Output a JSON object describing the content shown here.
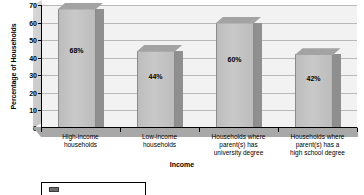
{
  "chart_data": {
    "type": "bar",
    "title": "",
    "xlabel": "Income",
    "ylabel": "Percentage of Households",
    "ylim": [
      0,
      70
    ],
    "ytick_step": 10,
    "yticks": [
      0,
      10,
      20,
      30,
      40,
      50,
      60,
      70
    ],
    "grid": true,
    "legend_position": "bottom-left",
    "style": "3d-column",
    "categories": [
      "High-income households",
      "Low-income households",
      "Households where parent(s) has university degree",
      "Households where parent(s) has a high school degree"
    ],
    "category_lines": [
      [
        "High-income",
        "households"
      ],
      [
        "Low-income",
        "households"
      ],
      [
        "Households where",
        "parent(s) has",
        "university degree"
      ],
      [
        "Households where",
        "parent(s) has a",
        "high school degree"
      ]
    ],
    "values": [
      68,
      44,
      60,
      42
    ],
    "data_labels": [
      "68%",
      "44%",
      "60%",
      "42%"
    ],
    "series": [
      {
        "name": "",
        "values": [
          68,
          44,
          60,
          42
        ]
      }
    ],
    "colors": {
      "bar_front": "#c4c4c4",
      "bar_side": "#8f8f8f",
      "bar_top": "#a3a3a3",
      "plot_background": "#f2f2f2",
      "gridline": "#b8b8b8",
      "axis": "#000000",
      "legend_swatch": "#6e6e6e"
    }
  },
  "legend": {
    "label": ""
  }
}
